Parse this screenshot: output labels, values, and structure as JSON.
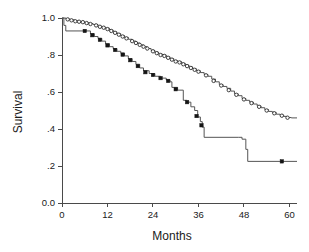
{
  "chart_data": {
    "type": "line",
    "title": "",
    "subtitle": "",
    "xlabel": "Months",
    "ylabel": "Survival",
    "xlim": [
      0,
      62
    ],
    "ylim": [
      0,
      1.0
    ],
    "xticks": [
      0,
      12,
      24,
      36,
      48,
      60
    ],
    "xticklabels": [
      "0",
      "12",
      "24",
      "36",
      "48",
      "60"
    ],
    "yticks": [
      0.0,
      0.2,
      0.4,
      0.6,
      0.8,
      1.0
    ],
    "yticklabels": [
      "0.0",
      ".2",
      ".4",
      ".6",
      ".8",
      "1.0"
    ],
    "grid": false,
    "legend": "none",
    "step_style": "post",
    "series": [
      {
        "name": "upper-curve",
        "marker": "open-circle",
        "final_value": 0.46,
        "x": [
          0,
          1.0,
          2.0,
          3.2,
          4.5,
          5.8,
          7.0,
          8.2,
          9.5,
          10.5,
          11.5,
          12.5,
          13.5,
          14.5,
          15.5,
          16.5,
          17.5,
          18.5,
          19.5,
          20.5,
          21.5,
          22.5,
          23.5,
          24.5,
          25.5,
          26.5,
          27.5,
          28.5,
          29.5,
          30.5,
          31.5,
          32.5,
          33.5,
          34.5,
          35.5,
          36.5,
          37.5,
          38.5,
          39.5,
          40.5,
          41.5,
          42.5,
          43.5,
          44.5,
          45.5,
          46.5,
          47.5,
          48.5,
          49.5,
          50.5,
          51.5,
          52.5,
          53.5,
          54.5,
          55.5,
          56.5,
          57.5,
          58.5,
          59.5,
          60.5,
          62
        ],
        "y": [
          1.0,
          0.995,
          0.99,
          0.985,
          0.98,
          0.975,
          0.97,
          0.965,
          0.955,
          0.95,
          0.945,
          0.935,
          0.925,
          0.915,
          0.905,
          0.895,
          0.885,
          0.875,
          0.865,
          0.855,
          0.845,
          0.835,
          0.825,
          0.815,
          0.805,
          0.8,
          0.79,
          0.78,
          0.77,
          0.765,
          0.755,
          0.745,
          0.735,
          0.725,
          0.715,
          0.705,
          0.695,
          0.685,
          0.67,
          0.655,
          0.64,
          0.63,
          0.62,
          0.605,
          0.59,
          0.58,
          0.565,
          0.555,
          0.545,
          0.535,
          0.525,
          0.515,
          0.505,
          0.495,
          0.49,
          0.48,
          0.475,
          0.468,
          0.462,
          0.46,
          0.46
        ],
        "censor_x": [
          1.5,
          2.5,
          3.5,
          4.5,
          5.5,
          6.5,
          7.5,
          9.0,
          10.0,
          11.0,
          12.0,
          13.0,
          14.0,
          15.0,
          16.0,
          17.0,
          18.5,
          19.5,
          20.5,
          21.5,
          22.5,
          24.0,
          25.0,
          26.0,
          27.0,
          28.0,
          29.0,
          30.0,
          31.0,
          32.0,
          33.0,
          34.0,
          35.0,
          36.0,
          38.0,
          40.0,
          42.0,
          44.0,
          46.0,
          48.0,
          50.0,
          52.0,
          54.0,
          56.0,
          58.0,
          59.5
        ],
        "censor_y": [
          0.9925,
          0.9875,
          0.9825,
          0.98,
          0.9775,
          0.9725,
          0.9675,
          0.96,
          0.9525,
          0.9475,
          0.94,
          0.93,
          0.92,
          0.91,
          0.9,
          0.89,
          0.875,
          0.865,
          0.855,
          0.845,
          0.835,
          0.82,
          0.81,
          0.8,
          0.795,
          0.785,
          0.775,
          0.765,
          0.76,
          0.75,
          0.74,
          0.73,
          0.72,
          0.71,
          0.69,
          0.66,
          0.635,
          0.61,
          0.585,
          0.56,
          0.54,
          0.52,
          0.5,
          0.485,
          0.472,
          0.461
        ]
      },
      {
        "name": "lower-curve",
        "marker": "filled-square",
        "final_value": 0.22,
        "x": [
          0,
          0.5,
          1.0,
          6.5,
          7.5,
          8.5,
          9.5,
          10.5,
          11.5,
          12.5,
          13.5,
          14.5,
          15.5,
          16.5,
          17.5,
          18.5,
          19.5,
          20.5,
          21.5,
          23.0,
          24.5,
          26.0,
          27.5,
          28.5,
          29.0,
          30.5,
          32.0,
          33.0,
          34.0,
          35.0,
          35.8,
          36.5,
          37.0,
          37.5,
          46.5,
          47.5,
          48.5,
          49.0,
          62
        ],
        "y": [
          1.0,
          0.96,
          0.93,
          0.93,
          0.915,
          0.9,
          0.89,
          0.875,
          0.86,
          0.845,
          0.835,
          0.82,
          0.81,
          0.795,
          0.78,
          0.765,
          0.75,
          0.73,
          0.715,
          0.7,
          0.685,
          0.675,
          0.665,
          0.655,
          0.625,
          0.61,
          0.555,
          0.545,
          0.52,
          0.5,
          0.465,
          0.44,
          0.41,
          0.355,
          0.355,
          0.345,
          0.29,
          0.225,
          0.225
        ],
        "censor_x": [
          6.0,
          8.0,
          10.0,
          12.0,
          14.0,
          16.0,
          18.0,
          20.0,
          22.0,
          24.0,
          26.0,
          28.0,
          30.0,
          33.0,
          35.5,
          36.8,
          58.0
        ],
        "censor_y": [
          0.93,
          0.907,
          0.882,
          0.852,
          0.827,
          0.802,
          0.772,
          0.74,
          0.707,
          0.692,
          0.675,
          0.66,
          0.615,
          0.545,
          0.47,
          0.42,
          0.225
        ]
      }
    ]
  },
  "axes": {
    "y_title": "Survival",
    "x_title": "Months"
  }
}
